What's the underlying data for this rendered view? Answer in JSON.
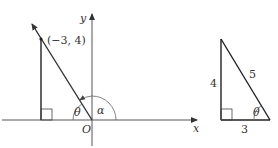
{
  "diagram": {
    "axes": {
      "x_label": "x",
      "y_label": "y",
      "origin_label": "O"
    },
    "point": {
      "label": "(−3, 4)",
      "x": -3,
      "y": 4
    },
    "angles": {
      "theta": "θ",
      "alpha": "α"
    },
    "triangle": {
      "opposite": "4",
      "hypotenuse": "5",
      "adjacent": "3",
      "angle": "θ"
    },
    "colors": {
      "line": "#222222",
      "axis": "#555555",
      "arc": "#666666"
    }
  }
}
